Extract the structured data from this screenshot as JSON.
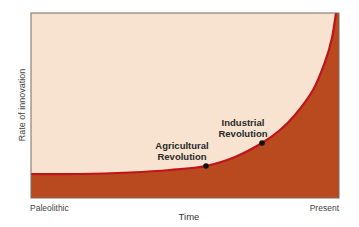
{
  "chart_data": {
    "type": "area",
    "title": "",
    "xlabel": "Time",
    "ylabel": "Rate of innovation",
    "x_tick_labels": [
      "Paleolithic",
      "Present"
    ],
    "y_tick_labels": [],
    "grid": false,
    "legend": null,
    "curve_shape": "exponential",
    "x": [
      0,
      0.2,
      0.4,
      0.55,
      0.6175,
      0.7,
      0.8,
      0.85,
      0.9,
      0.95,
      0.99
    ],
    "values": [
      0.13,
      0.135,
      0.15,
      0.18,
      0.2,
      0.27,
      0.37,
      0.44,
      0.56,
      0.74,
      1.0
    ],
    "annotations": [
      {
        "label": "Agricultural Revolution",
        "x": 0.6175,
        "y": 0.2
      },
      {
        "label": "Industrial Revolution",
        "x": 0.8,
        "y": 0.3
      }
    ],
    "colors": {
      "background": "#f7e3cf",
      "fill": "#b94a1f",
      "curve": "#c0141a",
      "frame": "#7a6a5e",
      "points": "#111111"
    }
  },
  "labels": {
    "ylabel": "Rate of innovation",
    "xlabel": "Time",
    "x_start": "Paleolithic",
    "x_end": "Present",
    "agri_line1": "Agricultural",
    "agri_line2": "Revolution",
    "ind_line1": "Industrial",
    "ind_line2": "Revolution"
  }
}
